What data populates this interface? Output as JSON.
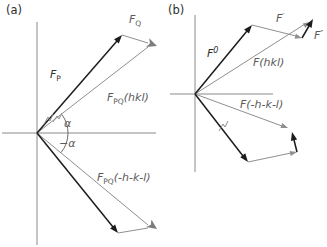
{
  "colors": {
    "bg": "#ffffff",
    "black": "#1c1c1c",
    "gray": "#8f8f8f",
    "fat": "#7d7d7d",
    "axis": "#8a8a8a",
    "textdark": "#2e2e2e",
    "textgray": "#5a5a5a"
  },
  "panel_a": {
    "tag": "(a)",
    "labels": {
      "fp": {
        "main": "F",
        "sub": "P"
      },
      "fq": {
        "main": "F",
        "sub": "Q"
      },
      "fpq_hkl": {
        "main": "F",
        "sub": "PQ",
        "suffix": "(hkl)"
      },
      "fpq_neg": {
        "main": "F",
        "sub": "PQ",
        "suffix": "(-h-k-l)"
      },
      "alpha": "α",
      "neg_alpha": "−α"
    }
  },
  "panel_b": {
    "tag": "(b)",
    "labels": {
      "f0": {
        "main": "F",
        "sup": "0"
      },
      "fprime": {
        "main": "F",
        "sup": "′"
      },
      "fdprime": {
        "main": "F",
        "sup": "″"
      },
      "f_hkl": "F(hkl)",
      "f_neg": "F(-h-k-l)"
    }
  }
}
